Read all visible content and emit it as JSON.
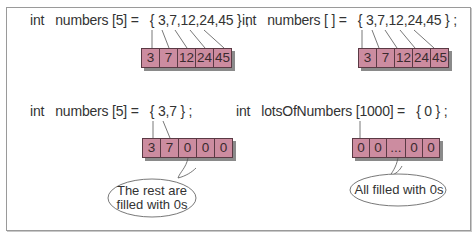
{
  "panels": [
    {
      "declaration": "int   numbers [5] =   { 3,7,12,24,45 } ;",
      "cells": [
        "3",
        "7",
        "12",
        "24",
        "45"
      ]
    },
    {
      "declaration": "int   numbers [ ] =   { 3,7,12,24,45 } ;",
      "cells": [
        "3",
        "7",
        "12",
        "24",
        "45"
      ]
    },
    {
      "declaration": "int   numbers [5] =   { 3,7 } ;",
      "cells": [
        "3",
        "7",
        "0",
        "0",
        "0"
      ],
      "callout_line1": "The rest  are",
      "callout_line2": "filled with 0s"
    },
    {
      "declaration": "int   lotsOfNumbers [1000] =   { 0 } ;",
      "cells": [
        "0",
        "0",
        "...",
        "0",
        "0"
      ],
      "callout_line1": "All filled with 0s"
    }
  ],
  "colors": {
    "cell_fill": "#cc8ca0",
    "cell_border": "#5a3a44",
    "shadow": "#8a8a8a",
    "frame_border": "#9a9a9a"
  }
}
